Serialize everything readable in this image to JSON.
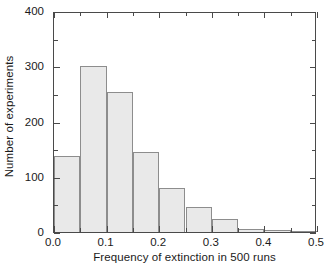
{
  "chart_data": {
    "type": "bar",
    "title": "",
    "xlabel": "Frequency of extinction in 500 runs",
    "ylabel": "Number of experiments",
    "xlim": [
      0.0,
      0.5
    ],
    "ylim": [
      0,
      400
    ],
    "grid": false,
    "legend": null,
    "bin_width": 0.05,
    "bin_edges": [
      0.0,
      0.05,
      0.1,
      0.15,
      0.2,
      0.25,
      0.3,
      0.35,
      0.4,
      0.45,
      0.5
    ],
    "categories": [
      "0.00-0.05",
      "0.05-0.10",
      "0.10-0.15",
      "0.15-0.20",
      "0.20-0.25",
      "0.25-0.30",
      "0.30-0.35",
      "0.35-0.40",
      "0.40-0.45",
      "0.45-0.50"
    ],
    "values": [
      137,
      300,
      253,
      145,
      80,
      46,
      23,
      5,
      4,
      2
    ],
    "xticks": [
      0.0,
      0.1,
      0.2,
      0.3,
      0.4,
      0.5
    ],
    "xticklabels": [
      "0.0",
      "0.1",
      "0.2",
      "0.3",
      "0.4",
      "0.5"
    ],
    "xminor_ticks": [
      0.05,
      0.15,
      0.25,
      0.35,
      0.45
    ],
    "yticks": [
      0,
      100,
      200,
      300,
      400
    ],
    "yticklabels": [
      "0",
      "100",
      "200",
      "300",
      "400"
    ],
    "yminor_ticks": [
      50,
      150,
      250,
      350
    ],
    "colors": {
      "bar_fill": "#e9e9e9",
      "bar_edge": "#8d8d8d",
      "axis": "#4a4a4a",
      "text": "#1a1a1a",
      "background": "#ffffff"
    }
  }
}
